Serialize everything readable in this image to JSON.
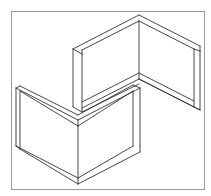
{
  "figure": {
    "line_color": "#333333",
    "frame_color": "#9a9a9a",
    "background": "#ffffff",
    "parts": [
      {
        "name": "upper-l-wall",
        "description": "Back corner formed by two walls meeting at the rear, opening toward the viewer"
      },
      {
        "name": "lower-l-wall",
        "description": "Front corner formed by two walls meeting at the front, opening away from the viewer"
      }
    ]
  }
}
